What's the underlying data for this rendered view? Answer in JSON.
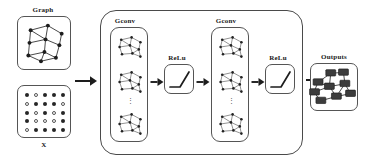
{
  "figure": {
    "background_color": "#ffffff",
    "line_color": "#555555",
    "text_color": "#1a1a1a"
  },
  "inputs": {
    "graph_label": "Graph",
    "matrix_label": "X",
    "graph_nodes": [
      {
        "x": 22,
        "y": 20
      },
      {
        "x": 52,
        "y": 12
      },
      {
        "x": 76,
        "y": 26
      },
      {
        "x": 20,
        "y": 42
      },
      {
        "x": 48,
        "y": 36
      },
      {
        "x": 72,
        "y": 46
      },
      {
        "x": 18,
        "y": 64
      },
      {
        "x": 46,
        "y": 58
      },
      {
        "x": 40,
        "y": 74
      },
      {
        "x": 66,
        "y": 68
      }
    ],
    "graph_edges": [
      [
        0,
        1
      ],
      [
        1,
        2
      ],
      [
        0,
        3
      ],
      [
        0,
        4
      ],
      [
        1,
        4
      ],
      [
        2,
        5
      ],
      [
        4,
        5
      ],
      [
        3,
        4
      ],
      [
        3,
        6
      ],
      [
        4,
        7
      ],
      [
        6,
        7
      ],
      [
        6,
        8
      ],
      [
        7,
        8
      ],
      [
        8,
        9
      ],
      [
        7,
        9
      ],
      [
        5,
        9
      ]
    ],
    "matrix_rows": 5,
    "matrix_cols": 5,
    "matrix_values": [
      [
        1,
        0,
        1,
        1,
        1
      ],
      [
        0,
        1,
        1,
        1,
        0
      ],
      [
        1,
        0,
        1,
        0,
        1
      ],
      [
        1,
        0,
        0,
        0,
        1
      ],
      [
        0,
        1,
        1,
        1,
        1
      ]
    ]
  },
  "pipeline": {
    "stages": [
      {
        "kind": "gconv",
        "label": "Gconv"
      },
      {
        "kind": "relu",
        "label": "ReLu"
      },
      {
        "kind": "gconv",
        "label": "Gconv"
      },
      {
        "kind": "relu",
        "label": "ReLu"
      }
    ],
    "gconv_channel_count_indicator": "⋮",
    "gconv_graphs_shown": 3,
    "small_graph_nodes": [
      {
        "x": 18,
        "y": 14
      },
      {
        "x": 44,
        "y": 8
      },
      {
        "x": 66,
        "y": 20
      },
      {
        "x": 14,
        "y": 32
      },
      {
        "x": 40,
        "y": 28
      },
      {
        "x": 62,
        "y": 38
      },
      {
        "x": 20,
        "y": 50
      },
      {
        "x": 46,
        "y": 48
      },
      {
        "x": 66,
        "y": 56
      }
    ],
    "small_graph_edges": [
      [
        0,
        1
      ],
      [
        1,
        2
      ],
      [
        0,
        3
      ],
      [
        0,
        4
      ],
      [
        1,
        4
      ],
      [
        2,
        5
      ],
      [
        4,
        5
      ],
      [
        3,
        4
      ],
      [
        3,
        6
      ],
      [
        4,
        7
      ],
      [
        6,
        7
      ],
      [
        7,
        8
      ],
      [
        5,
        8
      ],
      [
        7,
        5
      ]
    ],
    "relu_curve_note": "rectified linear unit activation curve"
  },
  "outputs": {
    "label": "Outputs",
    "node_count": 9,
    "nodes": [
      {
        "x": 10,
        "y": 22
      },
      {
        "x": 28,
        "y": 9
      },
      {
        "x": 46,
        "y": 8
      },
      {
        "x": 4,
        "y": 36
      },
      {
        "x": 26,
        "y": 28
      },
      {
        "x": 48,
        "y": 24
      },
      {
        "x": 14,
        "y": 48
      },
      {
        "x": 36,
        "y": 42
      },
      {
        "x": 56,
        "y": 38
      }
    ],
    "edges": [
      [
        0,
        1
      ],
      [
        1,
        2
      ],
      [
        0,
        3
      ],
      [
        0,
        4
      ],
      [
        1,
        4
      ],
      [
        2,
        5
      ],
      [
        4,
        5
      ],
      [
        3,
        4
      ],
      [
        3,
        6
      ],
      [
        4,
        7
      ],
      [
        6,
        7
      ],
      [
        7,
        8
      ],
      [
        5,
        8
      ],
      [
        5,
        7
      ]
    ]
  },
  "arrows": {
    "input_to_network": "→",
    "gconv_to_relu": "→",
    "relu_to_gconv": "→",
    "network_to_outputs": "→"
  }
}
